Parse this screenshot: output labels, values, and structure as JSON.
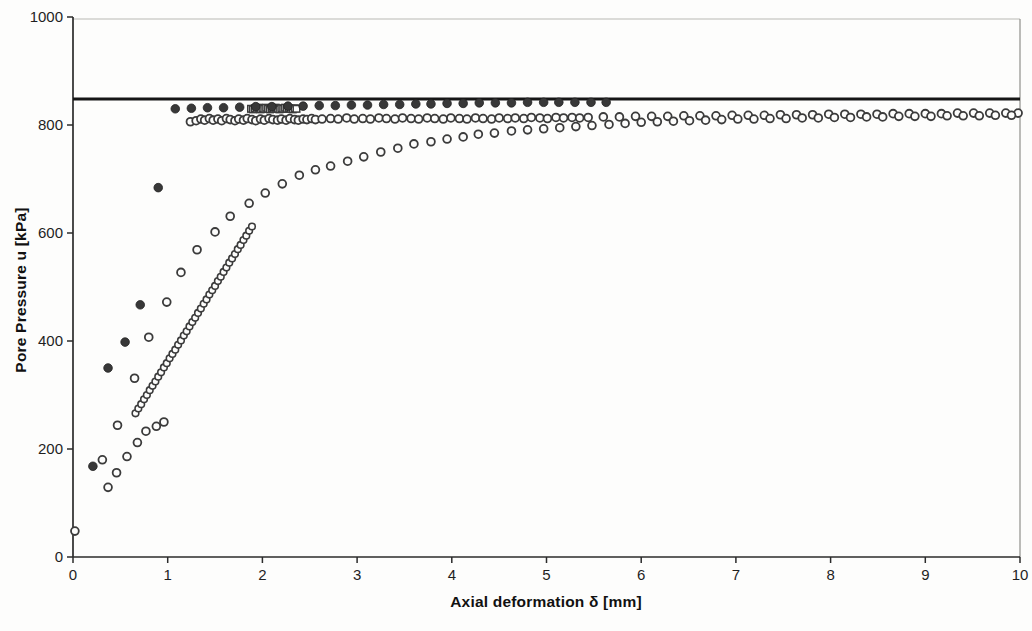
{
  "chart_data": {
    "type": "scatter",
    "title": "",
    "xlabel": "Axial deformation δ [mm]",
    "ylabel": "Pore Pressure u [kPa]",
    "xlim": [
      0,
      10
    ],
    "ylim": [
      0,
      1000
    ],
    "x_ticks": [
      "0",
      "1",
      "2",
      "3",
      "4",
      "5",
      "6",
      "7",
      "8",
      "9",
      "10"
    ],
    "x_tick_values": [
      0,
      1,
      2,
      3,
      4,
      5,
      6,
      7,
      8,
      9,
      10
    ],
    "y_ticks": [
      "0",
      "200",
      "400",
      "600",
      "800",
      "1000"
    ],
    "y_tick_values": [
      0,
      200,
      400,
      600,
      800,
      1000
    ],
    "grid": false,
    "legend": "none",
    "reference_line": {
      "y": 848,
      "color": "#161616",
      "width": 3
    },
    "series": [
      {
        "name": "dense-small-circle-train",
        "marker": "open-circle-small",
        "color": "#3b3b3b",
        "points": [
          [
            0.66,
            266
          ],
          [
            0.69,
            275
          ],
          [
            0.72,
            283
          ],
          [
            0.75,
            292
          ],
          [
            0.78,
            300
          ],
          [
            0.81,
            309
          ],
          [
            0.84,
            317
          ],
          [
            0.87,
            325
          ],
          [
            0.9,
            334
          ],
          [
            0.93,
            342
          ],
          [
            0.96,
            351
          ],
          [
            0.99,
            359
          ],
          [
            1.02,
            368
          ],
          [
            1.05,
            376
          ],
          [
            1.08,
            384
          ],
          [
            1.11,
            393
          ],
          [
            1.14,
            401
          ],
          [
            1.17,
            410
          ],
          [
            1.2,
            418
          ],
          [
            1.23,
            427
          ],
          [
            1.26,
            435
          ],
          [
            1.29,
            443
          ],
          [
            1.32,
            452
          ],
          [
            1.35,
            460
          ],
          [
            1.38,
            469
          ],
          [
            1.41,
            477
          ],
          [
            1.44,
            486
          ],
          [
            1.47,
            494
          ],
          [
            1.5,
            502
          ],
          [
            1.53,
            511
          ],
          [
            1.56,
            519
          ],
          [
            1.59,
            528
          ],
          [
            1.62,
            536
          ],
          [
            1.65,
            545
          ],
          [
            1.68,
            553
          ],
          [
            1.71,
            561
          ],
          [
            1.74,
            570
          ],
          [
            1.77,
            578
          ],
          [
            1.8,
            587
          ],
          [
            1.83,
            595
          ],
          [
            1.86,
            604
          ],
          [
            1.89,
            612
          ]
        ]
      },
      {
        "name": "dense-square-cluster",
        "marker": "open-square-small",
        "color": "#3b3b3b",
        "points": [
          [
            1.88,
            830
          ],
          [
            1.9,
            829
          ],
          [
            1.92,
            831
          ],
          [
            1.94,
            830
          ],
          [
            1.96,
            832
          ],
          [
            1.98,
            829
          ],
          [
            2.0,
            831
          ],
          [
            2.02,
            830
          ],
          [
            2.04,
            832
          ],
          [
            2.06,
            830
          ],
          [
            2.08,
            829
          ],
          [
            2.1,
            831
          ],
          [
            2.12,
            830
          ],
          [
            2.14,
            832
          ],
          [
            2.16,
            830
          ],
          [
            2.18,
            829
          ],
          [
            2.2,
            831
          ],
          [
            2.22,
            830
          ],
          [
            2.24,
            832
          ],
          [
            2.26,
            830
          ],
          [
            2.28,
            831
          ],
          [
            2.3,
            830
          ],
          [
            2.32,
            829
          ],
          [
            2.34,
            831
          ],
          [
            2.36,
            830
          ]
        ]
      },
      {
        "name": "open-circle-plateau",
        "marker": "open-circle",
        "color": "#3b3b3b",
        "points": [
          [
            1.24,
            806
          ],
          [
            1.3,
            808
          ],
          [
            1.35,
            811
          ],
          [
            1.39,
            809
          ],
          [
            1.44,
            812
          ],
          [
            1.48,
            809
          ],
          [
            1.53,
            811
          ],
          [
            1.57,
            808
          ],
          [
            1.62,
            812
          ],
          [
            1.66,
            810
          ],
          [
            1.71,
            808
          ],
          [
            1.75,
            811
          ],
          [
            1.8,
            809
          ],
          [
            1.84,
            812
          ],
          [
            1.89,
            810
          ],
          [
            1.93,
            808
          ],
          [
            1.98,
            811
          ],
          [
            2.02,
            809
          ],
          [
            2.07,
            812
          ],
          [
            2.11,
            810
          ],
          [
            2.16,
            809
          ],
          [
            2.2,
            811
          ],
          [
            2.25,
            809
          ],
          [
            2.29,
            812
          ],
          [
            2.34,
            810
          ],
          [
            2.38,
            809
          ],
          [
            2.43,
            811
          ],
          [
            2.47,
            810
          ],
          [
            2.52,
            812
          ],
          [
            2.56,
            810
          ],
          [
            2.63,
            811
          ],
          [
            2.72,
            812
          ],
          [
            2.8,
            811
          ],
          [
            2.89,
            813
          ],
          [
            2.97,
            811
          ],
          [
            3.06,
            812
          ],
          [
            3.14,
            811
          ],
          [
            3.23,
            813
          ],
          [
            3.31,
            812
          ],
          [
            3.4,
            811
          ],
          [
            3.48,
            813
          ],
          [
            3.57,
            812
          ],
          [
            3.65,
            811
          ],
          [
            3.74,
            813
          ],
          [
            3.82,
            812
          ],
          [
            3.91,
            811
          ],
          [
            3.99,
            813
          ],
          [
            4.08,
            812
          ],
          [
            4.16,
            811
          ],
          [
            4.25,
            813
          ],
          [
            4.33,
            812
          ],
          [
            4.42,
            811
          ],
          [
            4.5,
            813
          ],
          [
            4.59,
            812
          ],
          [
            4.67,
            813
          ],
          [
            4.76,
            812
          ],
          [
            4.84,
            814
          ],
          [
            4.93,
            813
          ],
          [
            5.01,
            812
          ],
          [
            5.1,
            814
          ],
          [
            5.18,
            813
          ],
          [
            5.27,
            814
          ],
          [
            5.35,
            813
          ],
          [
            5.44,
            814
          ],
          [
            5.6,
            815
          ],
          [
            5.77,
            815
          ],
          [
            5.94,
            816
          ],
          [
            6.11,
            816
          ],
          [
            6.28,
            816
          ],
          [
            6.45,
            817
          ],
          [
            6.62,
            817
          ],
          [
            6.79,
            817
          ],
          [
            6.96,
            818
          ],
          [
            7.13,
            818
          ],
          [
            7.3,
            818
          ],
          [
            7.47,
            819
          ],
          [
            7.64,
            819
          ],
          [
            7.81,
            819
          ],
          [
            7.98,
            820
          ],
          [
            8.15,
            820
          ],
          [
            8.32,
            820
          ],
          [
            8.49,
            820
          ],
          [
            8.66,
            821
          ],
          [
            8.83,
            821
          ],
          [
            9.0,
            821
          ],
          [
            9.17,
            821
          ],
          [
            9.34,
            822
          ],
          [
            9.51,
            822
          ],
          [
            9.68,
            822
          ],
          [
            9.85,
            822
          ],
          [
            9.98,
            822
          ]
        ]
      },
      {
        "name": "open-circle-gradual-curve",
        "marker": "open-circle",
        "color": "#3b3b3b",
        "points": [
          [
            0.47,
            244
          ],
          [
            0.65,
            331
          ],
          [
            0.8,
            407
          ],
          [
            0.99,
            472
          ],
          [
            1.14,
            527
          ],
          [
            1.31,
            569
          ],
          [
            1.5,
            602
          ],
          [
            1.66,
            631
          ],
          [
            1.86,
            655
          ],
          [
            2.03,
            674
          ],
          [
            2.21,
            691
          ],
          [
            2.39,
            707
          ],
          [
            2.56,
            717
          ],
          [
            2.72,
            724
          ],
          [
            2.9,
            733
          ],
          [
            3.07,
            741
          ],
          [
            3.25,
            750
          ],
          [
            3.43,
            757
          ],
          [
            3.6,
            765
          ],
          [
            3.78,
            769
          ],
          [
            3.95,
            774
          ],
          [
            4.12,
            778
          ],
          [
            4.28,
            783
          ],
          [
            4.45,
            785
          ],
          [
            4.63,
            789
          ],
          [
            4.8,
            791
          ],
          [
            4.97,
            793
          ],
          [
            5.14,
            795
          ],
          [
            5.31,
            797
          ],
          [
            5.48,
            799
          ],
          [
            5.66,
            801
          ],
          [
            5.83,
            803
          ],
          [
            6.0,
            805
          ],
          [
            6.17,
            806
          ],
          [
            6.34,
            807
          ],
          [
            6.51,
            808
          ],
          [
            6.68,
            809
          ],
          [
            6.85,
            810
          ],
          [
            7.02,
            811
          ],
          [
            7.19,
            811
          ],
          [
            7.36,
            812
          ],
          [
            7.53,
            812
          ],
          [
            7.7,
            813
          ],
          [
            7.87,
            813
          ],
          [
            8.04,
            814
          ],
          [
            8.21,
            814
          ],
          [
            8.38,
            815
          ],
          [
            8.55,
            815
          ],
          [
            8.72,
            816
          ],
          [
            8.89,
            816
          ],
          [
            9.06,
            816
          ],
          [
            9.23,
            817
          ],
          [
            9.4,
            817
          ],
          [
            9.57,
            817
          ],
          [
            9.74,
            818
          ],
          [
            9.91,
            818
          ]
        ]
      },
      {
        "name": "open-circle-low-scatter",
        "marker": "open-circle",
        "color": "#3b3b3b",
        "points": [
          [
            0.02,
            48
          ],
          [
            0.31,
            180
          ],
          [
            0.37,
            129
          ],
          [
            0.46,
            156
          ],
          [
            0.57,
            186
          ],
          [
            0.68,
            212
          ],
          [
            0.77,
            233
          ],
          [
            0.88,
            242
          ],
          [
            0.96,
            250
          ]
        ]
      },
      {
        "name": "filled-dots",
        "marker": "filled-circle",
        "color": "#383838",
        "points": [
          [
            0.21,
            168
          ],
          [
            0.37,
            350
          ],
          [
            0.55,
            398
          ],
          [
            0.71,
            467
          ],
          [
            0.9,
            684
          ],
          [
            1.08,
            830
          ],
          [
            1.25,
            831
          ],
          [
            1.42,
            832
          ],
          [
            1.59,
            832
          ],
          [
            1.76,
            833
          ],
          [
            1.93,
            834
          ],
          [
            2.1,
            834
          ],
          [
            2.27,
            835
          ],
          [
            2.43,
            835
          ],
          [
            2.6,
            836
          ],
          [
            2.77,
            836
          ],
          [
            2.94,
            837
          ],
          [
            3.11,
            837
          ],
          [
            3.28,
            838
          ],
          [
            3.45,
            838
          ],
          [
            3.62,
            839
          ],
          [
            3.78,
            839
          ],
          [
            3.95,
            840
          ],
          [
            4.12,
            840
          ],
          [
            4.29,
            841
          ],
          [
            4.46,
            841
          ],
          [
            4.63,
            841
          ],
          [
            4.8,
            842
          ],
          [
            4.97,
            842
          ],
          [
            5.13,
            842
          ],
          [
            5.3,
            842
          ],
          [
            5.47,
            842
          ],
          [
            5.63,
            842
          ]
        ]
      }
    ]
  },
  "figure": {
    "background": "#fdfdfc",
    "axis_color": "#2b2b2b",
    "faint_border_color": "#b9b9b4",
    "tick_label_color": "#1f1f1f",
    "plot": {
      "left": 73,
      "right": 1020,
      "top": 17,
      "bottom": 557
    }
  }
}
